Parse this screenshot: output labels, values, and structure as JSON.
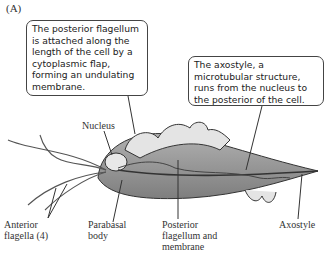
{
  "panel_label": "(A)",
  "callouts": [
    {
      "text": "The posterior flagellum is attached along the length of the cell by a cytoplasmic flap, forming an undulating membrane."
    },
    {
      "text": "The axostyle, a microtubular structure, runs from the nucleus to the posterior of the cell."
    }
  ],
  "labels": {
    "nucleus": "Nucleus",
    "anterior_flagella_1": "Anterior",
    "anterior_flagella_2": "flagella (4)",
    "parabasal_1": "Parabasal",
    "parabasal_2": "body",
    "posterior_1": "Posterior",
    "posterior_2": "flagellum and",
    "posterior_3": "membrane",
    "axostyle": "Axostyle"
  },
  "colors": {
    "cell_fill": "#9a9a9a",
    "membrane_fill": "#e4e4e4",
    "outline": "#333333"
  }
}
